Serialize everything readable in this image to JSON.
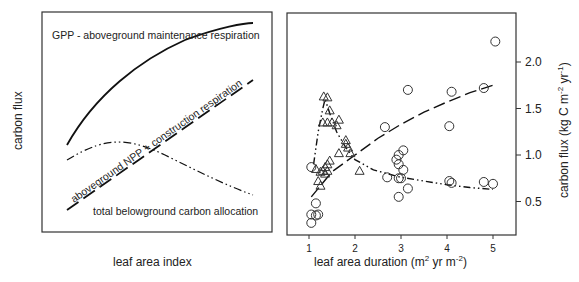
{
  "chart_data": [
    {
      "type": "line",
      "panel": "left",
      "title": "",
      "xlabel": "leaf area index",
      "ylabel": "carbon flux",
      "grid": false,
      "axes_ticks": false,
      "series": [
        {
          "name": "GPP - aboveground maintenance respiration",
          "style": "solid",
          "x": [
            0,
            0.1,
            0.2,
            0.3,
            0.4,
            0.5,
            0.6,
            0.7,
            0.8,
            0.9,
            1.0
          ],
          "values": [
            0.52,
            0.66,
            0.76,
            0.83,
            0.88,
            0.92,
            0.95,
            0.97,
            0.985,
            0.995,
            1.0
          ]
        },
        {
          "name": "aboveground NPP + construction respiration",
          "style": "dashed",
          "x": [
            0,
            1.0
          ],
          "values": [
            0.0,
            0.85
          ]
        },
        {
          "name": "total belowground carbon allocation",
          "style": "dash-dot-dot",
          "x": [
            0,
            0.1,
            0.2,
            0.3,
            0.4,
            0.5,
            0.6,
            0.7,
            0.8,
            0.9,
            1.0
          ],
          "values": [
            0.45,
            0.5,
            0.52,
            0.52,
            0.5,
            0.46,
            0.41,
            0.35,
            0.29,
            0.22,
            0.15
          ]
        }
      ],
      "annotations": [
        "GPP - aboveground maintenance respiration",
        "aboveground NPP + construction respiration",
        "total belowground carbon allocation"
      ]
    },
    {
      "type": "scatter",
      "panel": "right",
      "title": "",
      "xlabel": "leaf area duration (m² yr m⁻²)",
      "ylabel": "carbon flux (kg C m⁻² yr⁻¹)",
      "xlim": [
        0.7,
        5.5
      ],
      "ylim": [
        0.1,
        2.4
      ],
      "xticks": [
        1,
        2,
        3,
        4,
        5
      ],
      "yticks": [
        0.5,
        1.0,
        1.5,
        2.0
      ],
      "y_axis_position": "right",
      "grid": false,
      "series": [
        {
          "name": "circles",
          "marker": "circle",
          "x": [
            1.05,
            1.05,
            1.15,
            1.2,
            1.15,
            1.05,
            2.65,
            2.7,
            2.9,
            2.95,
            3.05,
            2.95,
            3.05,
            3.0,
            2.95,
            3.15,
            2.95,
            3.15,
            4.05,
            4.1,
            4.05,
            4.1,
            4.8,
            4.8,
            5.0,
            5.05
          ],
          "values": [
            0.87,
            0.36,
            0.48,
            0.36,
            0.35,
            0.27,
            1.3,
            0.76,
            0.95,
            1.0,
            1.05,
            0.9,
            0.84,
            0.75,
            0.55,
            0.64,
            0.75,
            1.7,
            1.31,
            1.68,
            0.72,
            0.7,
            1.72,
            0.71,
            0.69,
            2.22
          ]
        },
        {
          "name": "triangles",
          "marker": "triangle",
          "x": [
            1.32,
            1.4,
            1.45,
            1.3,
            1.4,
            1.5,
            1.65,
            1.6,
            1.8,
            1.8,
            1.85,
            1.9,
            1.65,
            1.45,
            1.4,
            1.35,
            1.3,
            1.25,
            1.35,
            1.4,
            1.2,
            1.25,
            2.1,
            1.15
          ],
          "values": [
            1.63,
            1.62,
            1.48,
            1.35,
            1.35,
            1.35,
            1.38,
            1.32,
            1.16,
            1.12,
            1.08,
            1.02,
            1.02,
            0.94,
            0.9,
            0.87,
            0.83,
            0.82,
            0.8,
            0.83,
            0.72,
            0.67,
            0.83,
            0.85
          ]
        },
        {
          "name": "dashed fit (circles)",
          "style": "dashed",
          "x": [
            1.05,
            1.5,
            2.0,
            2.5,
            3.0,
            3.5,
            4.0,
            4.5,
            5.0
          ],
          "values": [
            0.55,
            0.82,
            1.0,
            1.18,
            1.33,
            1.46,
            1.57,
            1.67,
            1.75
          ]
        },
        {
          "name": "dash-dot fit (triangles)",
          "style": "dash-dot-dot",
          "x": [
            1.1,
            1.2,
            1.3,
            1.35,
            1.45,
            1.6,
            1.8,
            2.0,
            2.4,
            3.0,
            3.5,
            4.0,
            4.5,
            5.0
          ],
          "values": [
            0.9,
            1.25,
            1.5,
            1.6,
            1.45,
            1.25,
            1.08,
            0.95,
            0.84,
            0.76,
            0.72,
            0.68,
            0.65,
            0.63
          ]
        }
      ]
    }
  ],
  "left_panel": {
    "ylabel": "carbon flux",
    "xlabel": "leaf area index",
    "label_gpp": "GPP - aboveground maintenance respiration",
    "label_npp": "aboveground NPP + construction respiration",
    "label_tbca": "total belowground carbon allocation"
  },
  "right_panel": {
    "xlabel_main": "leaf area duration (m",
    "xlabel_sup1": "2",
    "xlabel_mid": " yr m",
    "xlabel_sup2": "-2",
    "xlabel_end": ")",
    "ylabel_main": "carbon flux (kg C m",
    "ylabel_sup1": "-2",
    "ylabel_mid": " yr",
    "ylabel_sup2": "-1",
    "ylabel_end": ")",
    "xtick_labels": [
      "1",
      "2",
      "3",
      "4",
      "5"
    ],
    "ytick_labels": [
      "0.5",
      "1.0",
      "1.5",
      "2.0"
    ]
  }
}
